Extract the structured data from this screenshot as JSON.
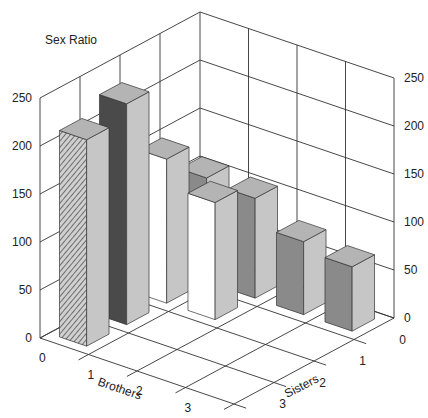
{
  "chart_data": {
    "type": "bar3d",
    "title": "Sex Ratio",
    "xlabel": "Brothers",
    "ylabel": "Sisters",
    "zlabel": "Sex Ratio",
    "x_categories": [
      "0",
      "1",
      "2",
      "3"
    ],
    "y_categories": [
      "0",
      "1",
      "2",
      "3"
    ],
    "z_ticks": [
      "0",
      "50",
      "100",
      "150",
      "200",
      "250"
    ],
    "zlim": [
      0,
      250
    ],
    "grid": true,
    "bars": [
      {
        "brothers": 0,
        "sisters": 3,
        "value": 215,
        "style": "hatched"
      },
      {
        "brothers": 0,
        "sisters": 2,
        "value": 230,
        "style": "dark"
      },
      {
        "brothers": 0,
        "sisters": 1,
        "value": 150,
        "style": "white"
      },
      {
        "brothers": 0,
        "sisters": 0,
        "value": 108,
        "style": "medium"
      },
      {
        "brothers": 1,
        "sisters": 1,
        "value": 122,
        "style": "white"
      },
      {
        "brothers": 1,
        "sisters": 0,
        "value": 104,
        "style": "medium"
      },
      {
        "brothers": 2,
        "sisters": 0,
        "value": 76,
        "style": "medium"
      },
      {
        "brothers": 3,
        "sisters": 0,
        "value": 67,
        "style": "medium"
      }
    ],
    "colors": {
      "hatched": "#bdbdbd",
      "hatch_line": "#555555",
      "dark": "#4a4a4a",
      "white": "#ffffff",
      "medium": "#8a8a8a",
      "side": "#c6c6c6",
      "top": "#b4b4b4"
    }
  }
}
